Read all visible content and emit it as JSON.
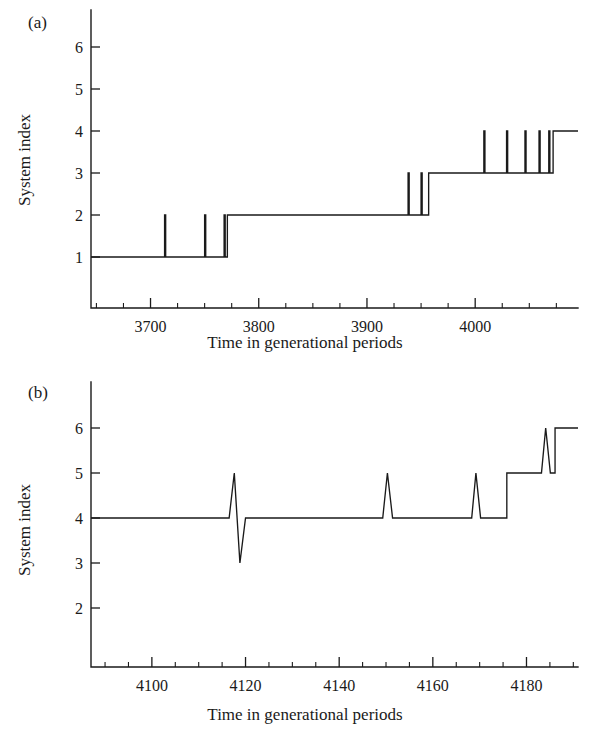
{
  "figure": {
    "background": "#ffffff",
    "line_color": "#1a1a1a",
    "panels": [
      "a",
      "b"
    ]
  },
  "panel_a": {
    "label": "(a)",
    "xlabel": "Time in generational periods",
    "ylabel": "System index"
  },
  "panel_b": {
    "label": "(b)",
    "xlabel": "Time in generational periods",
    "ylabel": "System index"
  },
  "chart_data": [
    {
      "type": "line",
      "panel": "a",
      "title": "(a)",
      "xlabel": "Time in generational periods",
      "ylabel": "System index",
      "xlim": [
        3645,
        4095
      ],
      "ylim": [
        0.35,
        6.7
      ],
      "grid": false,
      "legend": null,
      "xticks": [
        3700,
        3800,
        3900,
        4000
      ],
      "xtick_labels": [
        "3700",
        "3800",
        "3900",
        "4000"
      ],
      "xminor_step": 25,
      "yticks": [
        1,
        2,
        3,
        4,
        5,
        6
      ],
      "ytick_labels": [
        "1",
        "2",
        "3",
        "4",
        "5",
        "6"
      ],
      "step_style": "post",
      "description": "Stepwise increase of system index from 1 to 4 with transient upward spikes preceding each permanent transition.",
      "x": [
        3645,
        3713,
        3713,
        3714,
        3714,
        3750,
        3750,
        3751,
        3751,
        3768,
        3768,
        3769,
        3769,
        3771,
        3771,
        3938,
        3938,
        3939,
        3939,
        3950,
        3950,
        3951,
        3951,
        3957,
        3957,
        4008,
        4008,
        4009,
        4009,
        4029,
        4029,
        4030,
        4030,
        4046,
        4046,
        4047,
        4047,
        4059,
        4059,
        4060,
        4060,
        4068,
        4068,
        4069,
        4069,
        4072,
        4072,
        4095
      ],
      "y": [
        1,
        1,
        2,
        2,
        1,
        1,
        2,
        2,
        1,
        1,
        2,
        2,
        1,
        1,
        2,
        2,
        3,
        3,
        2,
        2,
        3,
        3,
        2,
        2,
        3,
        3,
        4,
        4,
        3,
        3,
        4,
        4,
        3,
        3,
        4,
        4,
        3,
        3,
        4,
        4,
        3,
        3,
        4,
        4,
        3,
        3,
        4,
        4
      ],
      "transitions": [
        {
          "time": 3771,
          "from": 1,
          "to": 2,
          "kind": "permanent"
        },
        {
          "time": 3957,
          "from": 2,
          "to": 3,
          "kind": "permanent"
        },
        {
          "time": 4072,
          "from": 3,
          "to": 4,
          "kind": "permanent"
        }
      ],
      "spikes": [
        {
          "time": 3713,
          "base": 1,
          "peak": 2
        },
        {
          "time": 3750,
          "base": 1,
          "peak": 2
        },
        {
          "time": 3768,
          "base": 1,
          "peak": 2
        },
        {
          "time": 3938,
          "base": 2,
          "peak": 3
        },
        {
          "time": 3950,
          "base": 2,
          "peak": 3
        },
        {
          "time": 4008,
          "base": 3,
          "peak": 4
        },
        {
          "time": 4029,
          "base": 3,
          "peak": 4
        },
        {
          "time": 4046,
          "base": 3,
          "peak": 4
        },
        {
          "time": 4059,
          "base": 3,
          "peak": 4
        },
        {
          "time": 4068,
          "base": 3,
          "peak": 4
        }
      ]
    },
    {
      "type": "line",
      "panel": "b",
      "title": "(b)",
      "xlabel": "Time in generational periods",
      "ylabel": "System index",
      "xlim": [
        4087,
        4191
      ],
      "ylim": [
        0.35,
        6.7
      ],
      "grid": false,
      "legend": null,
      "xticks": [
        4100,
        4120,
        4140,
        4160,
        4180
      ],
      "xtick_labels": [
        "4100",
        "4120",
        "4140",
        "4160",
        "4180"
      ],
      "xminor_step": 5,
      "yticks": [
        2,
        3,
        4,
        5,
        6
      ],
      "ytick_labels": [
        "2",
        "3",
        "4",
        "5",
        "6"
      ],
      "step_style": "linear",
      "description": "System index holds at 4 with sharp transient excursions, then steps up to 5 and finally to 6 near the end of the record.",
      "x": [
        4087,
        4116.5,
        4117.6,
        4118.8,
        4120,
        4149.3,
        4150.3,
        4151.4,
        4168.3,
        4169.2,
        4170.2,
        4175.8,
        4175.8,
        4183.2,
        4184.1,
        4185.1,
        4186.1,
        4186.1,
        4191
      ],
      "y": [
        4,
        4,
        5,
        3,
        4,
        4,
        5,
        4,
        4,
        5,
        4,
        4,
        5,
        5,
        6,
        5,
        5,
        6,
        6
      ],
      "transitions": [
        {
          "time": 4175.8,
          "from": 4,
          "to": 5,
          "kind": "permanent"
        },
        {
          "time": 4186.1,
          "from": 5,
          "to": 6,
          "kind": "permanent"
        }
      ],
      "spikes": [
        {
          "time": 4117.6,
          "base": 4,
          "peak": 5,
          "followed_by_dip_to": 3
        },
        {
          "time": 4150.3,
          "base": 4,
          "peak": 5
        },
        {
          "time": 4169.2,
          "base": 4,
          "peak": 5
        },
        {
          "time": 4184.1,
          "base": 5,
          "peak": 6
        }
      ]
    }
  ]
}
